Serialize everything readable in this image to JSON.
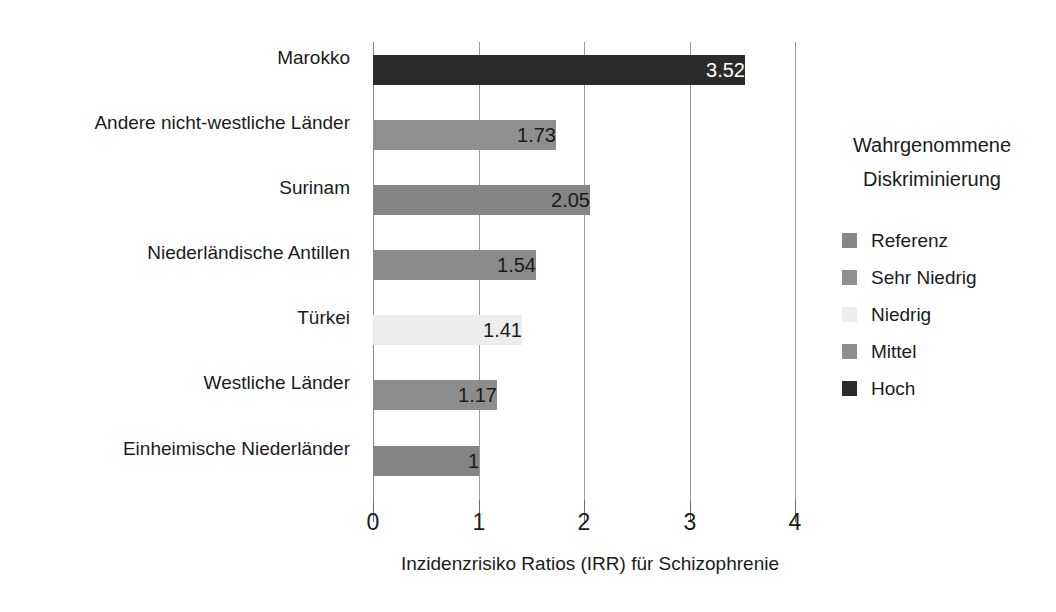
{
  "chart_data": {
    "type": "bar",
    "orientation": "horizontal",
    "title": "",
    "xlabel": "Inzidenzrisiko Ratios (IRR) für Schizophrenie",
    "ylabel": "",
    "xlim": [
      0,
      4
    ],
    "xticks": [
      "0",
      "1",
      "2",
      "3",
      "4"
    ],
    "xtick_values": [
      0,
      1,
      2,
      3,
      4
    ],
    "grid": true,
    "legend_position": "right",
    "categories": [
      "Marokko",
      "Andere nicht-westliche Länder",
      "Surinam",
      "Niederländische Antillen",
      "Türkei",
      "Westliche Länder",
      "Einheimische Niederländer"
    ],
    "values": [
      3.52,
      1.73,
      2.05,
      1.54,
      1.41,
      1.17,
      1
    ],
    "value_labels": [
      "3.52",
      "1.73",
      "2.05",
      "1.54",
      "1.41",
      "1.17",
      "1"
    ],
    "bar_colors": [
      "#2b2b2b",
      "#8f8f8f",
      "#848484",
      "#8b8b8b",
      "#ededed",
      "#8d8d8d",
      "#848484"
    ],
    "value_label_colors": [
      "#ffffff",
      "#1a1a1a",
      "#1a1a1a",
      "#1a1a1a",
      "#1a1a1a",
      "#1a1a1a",
      "#1a1a1a"
    ],
    "legend": {
      "title_line1": "Wahrgenommene",
      "title_line2": "Diskriminierung",
      "entries": [
        {
          "label": "Referenz",
          "color": "#878787"
        },
        {
          "label": "Sehr Niedrig",
          "color": "#8f8f8f"
        },
        {
          "label": "Niedrig",
          "color": "#ededed"
        },
        {
          "label": "Mittel",
          "color": "#8d8d8d"
        },
        {
          "label": "Hoch",
          "color": "#2b2b2b"
        }
      ]
    }
  }
}
